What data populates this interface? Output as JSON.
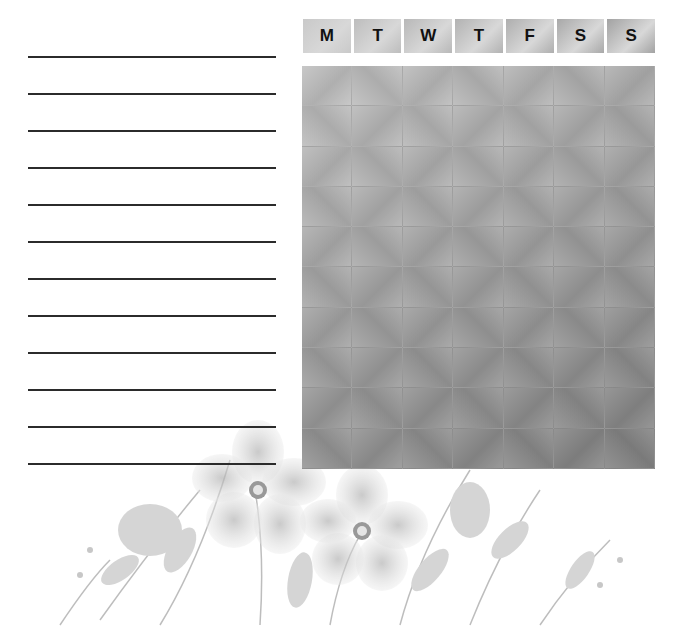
{
  "planner": {
    "type": "weekly habit tracker",
    "days": [
      {
        "label": "M",
        "shade": "#c9c9c9"
      },
      {
        "label": "T",
        "shade": "#bdbdbd"
      },
      {
        "label": "W",
        "shade": "#b8b8b8"
      },
      {
        "label": "T",
        "shade": "#b2b2b2"
      },
      {
        "label": "F",
        "shade": "#aeaeae"
      },
      {
        "label": "S",
        "shade": "#a8a8a8"
      },
      {
        "label": "S",
        "shade": "#a2a2a2"
      }
    ],
    "rows": 10,
    "writing_lines": 12,
    "line_tops": [
      56,
      93,
      130,
      167,
      204,
      241,
      278,
      315,
      352,
      389,
      426,
      463
    ],
    "grid_colors": {
      "light": "#c2c2c2",
      "dark": "#8e8e8e"
    },
    "decoration": "watercolor-floral-bouquet"
  }
}
